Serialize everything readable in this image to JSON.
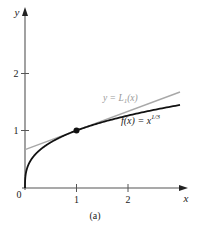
{
  "chart_data": {
    "type": "line",
    "title": "",
    "caption": "(a)",
    "xlabel": "x",
    "ylabel": "y",
    "xlim": [
      0,
      3.1
    ],
    "ylim": [
      0,
      2.7
    ],
    "x_ticks": [
      {
        "value": 1,
        "label": "1"
      },
      {
        "value": 2,
        "label": "2"
      }
    ],
    "y_ticks": [
      {
        "value": 1,
        "label": "1"
      },
      {
        "value": 2,
        "label": "2"
      }
    ],
    "origin_label": "0",
    "grid": false,
    "legend": null,
    "series": [
      {
        "name": "f(x) = x^1/3",
        "label_text": "f(x) = x",
        "label_exponent": "1/3",
        "color": "#111111",
        "function": "x^(1/3)",
        "x": [
          0,
          0.05,
          0.1,
          0.2,
          0.4,
          0.6,
          0.8,
          1.0,
          1.5,
          2.0,
          2.5,
          3.0
        ],
        "y": [
          0,
          0.368,
          0.464,
          0.585,
          0.737,
          0.843,
          0.928,
          1.0,
          1.145,
          1.26,
          1.357,
          1.442
        ]
      },
      {
        "name": "y = L1(x)",
        "label_text": "y = L",
        "label_subscript": "1",
        "label_suffix": "(x)",
        "color": "#a8a8a8",
        "function": "2/3 + x/3",
        "x": [
          0,
          1,
          2,
          3
        ],
        "y": [
          0.667,
          1.0,
          1.333,
          1.667
        ]
      }
    ],
    "points": [
      {
        "x": 1,
        "y": 1,
        "label": "point of tangency",
        "color": "#111111"
      }
    ]
  },
  "colors": {
    "axis": "#555555",
    "curve": "#111111",
    "tangent": "#a8a8a8",
    "text": "#222222"
  }
}
